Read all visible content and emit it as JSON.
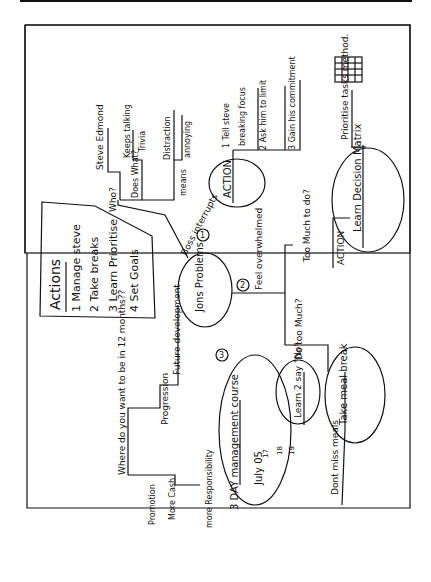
{
  "figure": {
    "type": "hand-drawn mind map (rotated 90° counter-clockwise)",
    "central_node": "Jons Problems",
    "actions_box": {
      "title": "Actions",
      "items": [
        "1 Manage steve",
        "2 Take breaks",
        "3 Learn Prioritise",
        "4 Set Goals"
      ]
    },
    "branch1": {
      "marker": "1",
      "label": "Boss interrupts",
      "who_label": "Who?",
      "who_value": "Steve Edmond",
      "does_what_label": "Does What?",
      "does_what_values": [
        "Keeps talking",
        "Trivia"
      ],
      "means_label": "means",
      "means_values": [
        "Distraction",
        "annoying"
      ],
      "action_node": "ACTION",
      "actions": [
        "1 Tell steve",
        "breaking focus",
        "2 Ask him to limit",
        "3 Gain his commitment"
      ]
    },
    "branch2": {
      "marker": "2",
      "label": "Feel overwhelmed",
      "too_much_label": "Too Much to do?",
      "action_label": "ACTION",
      "action_node": "Learn Decision Matrix",
      "prioritise_label": "Prioritise tasks method.",
      "grid_icon": "decision-matrix-grid",
      "do_too_much_label": "Do too Much?",
      "say_no_node": "Learn 2 say \"No\"",
      "meal_break_node": "Take meal break",
      "meals_label": "Dont miss meals"
    },
    "branch3": {
      "marker": "3",
      "label": "Future development",
      "progression_label": "Progression",
      "question": "Where do you want to be in 12 months??",
      "goals": [
        "Promotion",
        "More Cash",
        "more Responsibility"
      ],
      "course_node": "3 DAY management course",
      "course_date": "July 05",
      "course_days": [
        "17",
        "18",
        "19"
      ]
    }
  }
}
